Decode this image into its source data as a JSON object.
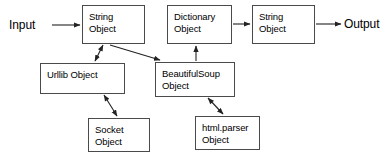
{
  "diagram": {
    "stroke_color": "#4a4a4a",
    "text_color": "#000000",
    "background_color": "#ffffff",
    "labels": [
      {
        "id": "input",
        "text": "Input",
        "x": 9,
        "y": 19
      },
      {
        "id": "output",
        "text": "Output",
        "x": 344,
        "y": 18
      }
    ],
    "nodes": [
      {
        "id": "string-object-left",
        "text": "String\nObject",
        "x": 82,
        "y": 5,
        "w": 63,
        "h": 39
      },
      {
        "id": "dictionary-object",
        "text": "Dictionary\nObject",
        "x": 167,
        "y": 5,
        "w": 65,
        "h": 39
      },
      {
        "id": "string-object-right",
        "text": "String\nObject",
        "x": 252,
        "y": 5,
        "w": 63,
        "h": 39
      },
      {
        "id": "urllib-object",
        "text": "Urllib Object",
        "x": 40,
        "y": 63,
        "w": 85,
        "h": 31
      },
      {
        "id": "beautifulsoup-object",
        "text": "BeautifulSoup\nObject",
        "x": 155,
        "y": 62,
        "w": 80,
        "h": 35
      },
      {
        "id": "socket-object",
        "text": "Socket\nObject",
        "x": 88,
        "y": 118,
        "w": 62,
        "h": 34
      },
      {
        "id": "htmlparser-object",
        "text": "html.parser\nObject",
        "x": 195,
        "y": 116,
        "w": 65,
        "h": 34
      }
    ],
    "edges": [
      {
        "id": "input-to-string-left",
        "from": "input",
        "to": "string-object-left",
        "arrows": "end"
      },
      {
        "id": "dictionary-to-string-right",
        "from": "dictionary-object",
        "to": "string-object-right",
        "arrows": "end"
      },
      {
        "id": "string-right-to-output",
        "from": "string-object-right",
        "to": "output",
        "arrows": "end"
      },
      {
        "id": "string-left-to-urllib",
        "from": "string-object-left",
        "to": "urllib-object",
        "arrows": "both"
      },
      {
        "id": "string-left-to-beautifulsoup",
        "from": "string-object-left",
        "to": "beautifulsoup-object",
        "arrows": "end"
      },
      {
        "id": "urllib-to-socket",
        "from": "urllib-object",
        "to": "socket-object",
        "arrows": "both"
      },
      {
        "id": "beautifulsoup-to-dictionary",
        "from": "beautifulsoup-object",
        "to": "dictionary-object",
        "arrows": "end"
      },
      {
        "id": "beautifulsoup-to-htmlparser",
        "from": "beautifulsoup-object",
        "to": "htmlparser-object",
        "arrows": "both"
      }
    ]
  }
}
